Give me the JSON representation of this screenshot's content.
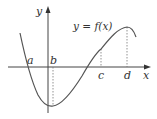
{
  "diagram": {
    "type": "function-graph",
    "function_label": "y = f(x)",
    "axes": {
      "x_label": "x",
      "y_label": "y"
    },
    "points": [
      {
        "label": "a",
        "meaning": "x-intercept left of origin"
      },
      {
        "label": "b",
        "meaning": "x-coordinate of local minimum"
      },
      {
        "label": "c",
        "meaning": "point on positive x-axis"
      },
      {
        "label": "d",
        "meaning": "x-coordinate of local maximum"
      }
    ],
    "colors": {
      "curve": "#555555",
      "axis": "#444444",
      "text": "#333333",
      "background": "#ffffff"
    }
  }
}
